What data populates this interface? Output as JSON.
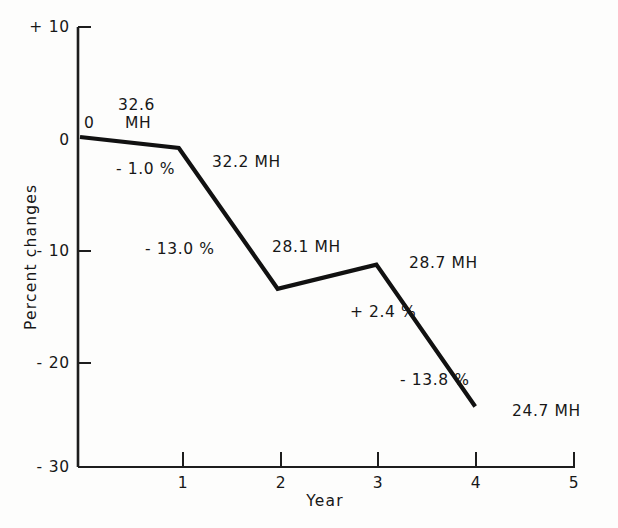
{
  "chart_data": {
    "type": "line",
    "title": "",
    "xlabel": "Year",
    "ylabel": "Percent changes",
    "xlim": [
      0,
      5
    ],
    "ylim": [
      -30,
      10
    ],
    "grid": false,
    "legend": "none",
    "x_ticks": [
      "1",
      "2",
      "3",
      "4",
      "5"
    ],
    "x_tick_values": [
      1,
      2,
      3,
      4,
      5
    ],
    "y_ticks": [
      "+ 10",
      "0",
      "- 10",
      "- 20",
      "- 30"
    ],
    "y_tick_values": [
      10,
      0,
      -10,
      -20,
      -30
    ],
    "x": [
      0,
      1,
      2,
      3,
      4
    ],
    "values": [
      0.0,
      -1.0,
      -13.8,
      -11.6,
      -24.5
    ],
    "series": [
      {
        "name": "Percent change from year 0",
        "x": [
          0,
          1,
          2,
          3,
          4
        ],
        "values": [
          0.0,
          -1.0,
          -13.8,
          -11.6,
          -24.5
        ]
      }
    ],
    "point_labels": [
      "32.6\nMH",
      "32.2 MH",
      "28.1 MH",
      "28.7 MH",
      "24.7 MH"
    ],
    "point_values_mh": [
      32.6,
      32.2,
      28.1,
      28.7,
      24.7
    ],
    "segment_labels": [
      "- 1.0 %",
      "- 13.0 %",
      "+ 2.4 %",
      "- 13.8 %"
    ],
    "segment_values_pct": [
      -1.0,
      -13.0,
      2.4,
      -13.8
    ],
    "origin_label": "0",
    "line_color": "#111111",
    "axis_color": "#222222",
    "background_color": "#fdfdfc"
  },
  "axes": {
    "y_title": "Percent changes",
    "x_title": "Year",
    "y_tick_labels": [
      {
        "text": "+ 10",
        "value": 10
      },
      {
        "text": "0",
        "value": 0
      },
      {
        "text": "- 10",
        "value": -10
      },
      {
        "text": "- 20",
        "value": -20
      },
      {
        "text": "- 30",
        "value": -30
      }
    ],
    "x_tick_labels": [
      {
        "text": "1",
        "value": 1
      },
      {
        "text": "2",
        "value": 2
      },
      {
        "text": "3",
        "value": 3
      },
      {
        "text": "4",
        "value": 4
      },
      {
        "text": "5",
        "value": 5
      }
    ]
  },
  "annotations": {
    "origin_zero": "0",
    "mh_start_line1": "32.6",
    "mh_start_line2": "MH",
    "pct_1": "- 1.0 %",
    "mh_1": "32.2 MH",
    "pct_2": "- 13.0 %",
    "mh_2": "28.1 MH",
    "mh_3": "28.7 MH",
    "pct_3": "+ 2.4 %",
    "pct_4": "- 13.8 %",
    "mh_4": "24.7 MH"
  }
}
